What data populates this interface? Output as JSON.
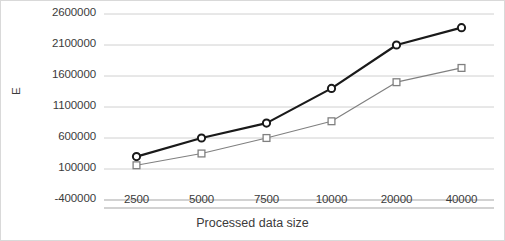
{
  "chart_data": {
    "type": "line",
    "title": "",
    "xlabel": "Processed data size",
    "ylabel": "E",
    "categories": [
      "2500",
      "5000",
      "7500",
      "10000",
      "20000",
      "40000"
    ],
    "ylim": [
      -400000,
      2600000
    ],
    "yticks": [
      "-400000",
      "100000",
      "600000",
      "1100000",
      "1600000",
      "2100000",
      "2600000"
    ],
    "ytick_values": [
      -400000,
      100000,
      600000,
      1100000,
      1600000,
      2100000,
      2600000
    ],
    "grid": true,
    "legend": "none",
    "series": [
      {
        "name": "series-circle",
        "marker": "circle",
        "color": "#1a1a1a",
        "line_width": 2.2,
        "values": [
          300000,
          600000,
          840000,
          1400000,
          2100000,
          2380000
        ]
      },
      {
        "name": "series-square",
        "marker": "square",
        "color": "#808080",
        "line_width": 1.2,
        "values": [
          160000,
          350000,
          600000,
          870000,
          1500000,
          1730000
        ]
      }
    ]
  },
  "axis": {
    "y_axis_label": "E",
    "x_axis_label": "Processed data size"
  }
}
